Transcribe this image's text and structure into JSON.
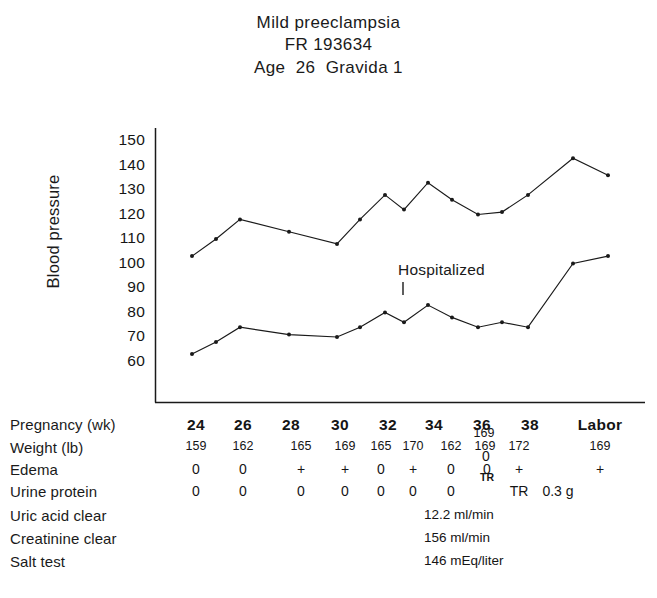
{
  "title": {
    "line1": "Mild preeclampsia",
    "line2": "FR 193634",
    "line3": "Age  26  Gravida 1"
  },
  "axis": {
    "y_title": "Blood pressure",
    "y_ticks": [
      "150",
      "140",
      "130",
      "120",
      "110",
      "100",
      "90",
      "80",
      "70",
      "60"
    ]
  },
  "annotations": {
    "hospitalized": "Hospitalized"
  },
  "table": {
    "row_labels": {
      "pregnancy": "Pregnancy (wk)",
      "weight": "Weight (lb)",
      "edema": "Edema",
      "urine_protein": "Urine protein",
      "uric_acid": "Uric acid clear",
      "creatinine": "Creatinine clear",
      "salt_test": "Salt test"
    },
    "weeks": [
      "24",
      "26",
      "28",
      "30",
      "32",
      "34",
      "36",
      "38",
      "Labor"
    ],
    "weights": [
      "159",
      "162",
      "165",
      "169",
      "165",
      "170",
      "162",
      "169",
      "172",
      "169"
    ],
    "weight_extra": "169",
    "edema": [
      "0",
      "0",
      "+",
      "+",
      "0",
      "+",
      "0",
      "0",
      "+",
      "+"
    ],
    "edema_extra": "0",
    "urine_protein": [
      "0",
      "0",
      "0",
      "0",
      "0",
      "0",
      "0",
      "TR",
      "0.3 g"
    ],
    "urine_protein_extra": "TR",
    "labs": {
      "uric_acid_value": "12.2 ml/min",
      "creatinine_value": "156 ml/min",
      "salt_test_value": "146 mEq/liter"
    }
  },
  "chart_data": {
    "type": "line",
    "xlabel": "Pregnancy (wk)",
    "ylabel": "Blood pressure",
    "ylim": [
      55,
      155
    ],
    "yticks": [
      60,
      70,
      80,
      90,
      100,
      110,
      120,
      130,
      140,
      150
    ],
    "grid": false,
    "legend": "none",
    "x": [
      "24",
      "25",
      "26",
      "28",
      "30",
      "31",
      "32",
      "33",
      "34",
      "35",
      "36",
      "37",
      "38",
      "Labor",
      "Labor+"
    ],
    "series": [
      {
        "name": "Systolic",
        "values": [
          103,
          110,
          118,
          113,
          108,
          118,
          128,
          122,
          133,
          126,
          120,
          121,
          128,
          143,
          136
        ]
      },
      {
        "name": "Diastolic",
        "values": [
          63,
          68,
          74,
          71,
          70,
          74,
          80,
          76,
          83,
          78,
          74,
          76,
          74,
          100,
          103
        ]
      }
    ],
    "annotations": [
      {
        "text": "Hospitalized",
        "x": "33",
        "y": 98
      }
    ]
  }
}
